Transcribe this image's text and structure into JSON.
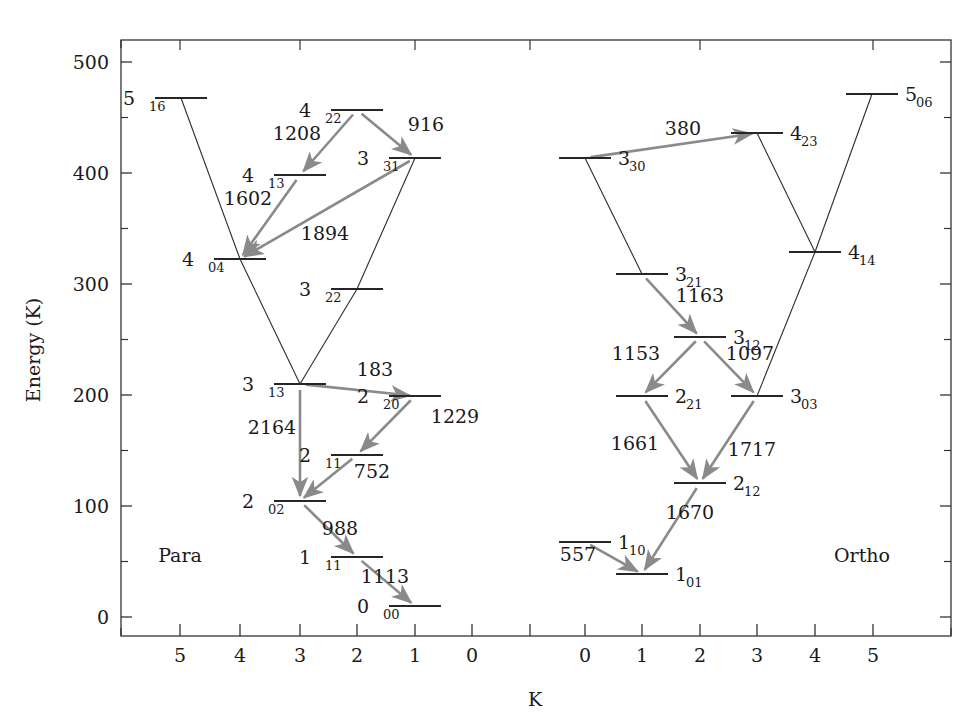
{
  "figure": {
    "xlabel": "K",
    "ylabel": "Energy (K)",
    "branch_left_label": "Para",
    "branch_right_label": "Ortho",
    "colors": {
      "level_line": "#262626",
      "connector_line": "#2b2b2b",
      "transition_arrow": "#8a8a8a",
      "frame": "#333333",
      "text": "#1a1a1a",
      "background": "#ffffff"
    }
  },
  "chart_data": {
    "type": "diagram",
    "title": "",
    "xlabel": "K",
    "ylabel": "Energy (K)",
    "ylim": [
      0,
      540
    ],
    "y_major_ticks": [
      0,
      100,
      200,
      300,
      400,
      500
    ],
    "y_minor_ticks": [
      50,
      150,
      250,
      350,
      450
    ],
    "y_tick_labels": [
      "0",
      "100",
      "200",
      "300",
      "400",
      "500"
    ],
    "x_tick_labels_left": [
      "5",
      "4",
      "3",
      "2",
      "1",
      "0"
    ],
    "x_tick_labels_right": [
      "0",
      "1",
      "2",
      "3",
      "4",
      "5"
    ],
    "grid": false,
    "legend": "none",
    "branches": [
      "Para",
      "Ortho"
    ],
    "levels": [
      {
        "id": "p516",
        "branch": "Para",
        "label": "5",
        "sub": "16",
        "K": 5,
        "energy": 468,
        "px": 181,
        "py": 98,
        "label_side": "left"
      },
      {
        "id": "p422",
        "branch": "Para",
        "label": "4",
        "sub": "22",
        "K": 2,
        "energy": 458,
        "px": 357,
        "py": 110,
        "label_side": "left"
      },
      {
        "id": "p331",
        "branch": "Para",
        "label": "3",
        "sub": "31",
        "K": 1,
        "energy": 415,
        "px": 415,
        "py": 158,
        "label_side": "left"
      },
      {
        "id": "p413",
        "branch": "Para",
        "label": "4",
        "sub": "13",
        "K": 3,
        "energy": 396,
        "px": 300,
        "py": 175,
        "label_side": "left"
      },
      {
        "id": "p404",
        "branch": "Para",
        "label": "4",
        "sub": "04",
        "K": 4,
        "energy": 322,
        "px": 240,
        "py": 259,
        "label_side": "left"
      },
      {
        "id": "p322",
        "branch": "Para",
        "label": "3",
        "sub": "22",
        "K": 2,
        "energy": 296,
        "px": 357,
        "py": 289,
        "label_side": "left"
      },
      {
        "id": "p313",
        "branch": "Para",
        "label": "3",
        "sub": "13",
        "K": 3,
        "energy": 211,
        "px": 300,
        "py": 384,
        "label_side": "left"
      },
      {
        "id": "p220",
        "branch": "Para",
        "label": "2",
        "sub": "20",
        "K": 1,
        "energy": 200,
        "px": 415,
        "py": 396,
        "label_side": "left"
      },
      {
        "id": "p211",
        "branch": "Para",
        "label": "2",
        "sub": "11",
        "K": 2,
        "energy": 146,
        "px": 357,
        "py": 455,
        "label_side": "left"
      },
      {
        "id": "p202",
        "branch": "Para",
        "label": "2",
        "sub": "02",
        "K": 3,
        "energy": 104,
        "px": 300,
        "py": 501,
        "label_side": "left"
      },
      {
        "id": "p111",
        "branch": "Para",
        "label": "1",
        "sub": "11",
        "K": 2,
        "energy": 54,
        "px": 357,
        "py": 557,
        "label_side": "left"
      },
      {
        "id": "p000",
        "branch": "Para",
        "label": "0",
        "sub": "00",
        "K": 1,
        "energy": 10,
        "px": 415,
        "py": 606,
        "label_side": "left"
      },
      {
        "id": "o506",
        "branch": "Ortho",
        "label": "5",
        "sub": "06",
        "K": 5,
        "energy": 472,
        "px": 872,
        "py": 94,
        "label_side": "right"
      },
      {
        "id": "o423",
        "branch": "Ortho",
        "label": "4",
        "sub": "23",
        "K": 3,
        "energy": 436,
        "px": 757,
        "py": 133,
        "label_side": "right"
      },
      {
        "id": "o330",
        "branch": "Ortho",
        "label": "3",
        "sub": "30",
        "K": 0,
        "energy": 414,
        "px": 585,
        "py": 158,
        "label_side": "right"
      },
      {
        "id": "o414",
        "branch": "Ortho",
        "label": "4",
        "sub": "14",
        "K": 4,
        "energy": 329,
        "px": 815,
        "py": 252,
        "label_side": "right"
      },
      {
        "id": "o321",
        "branch": "Ortho",
        "label": "3",
        "sub": "21",
        "K": 1,
        "energy": 310,
        "px": 642,
        "py": 274,
        "label_side": "right"
      },
      {
        "id": "o312",
        "branch": "Ortho",
        "label": "3",
        "sub": "12",
        "K": 2,
        "energy": 253,
        "px": 700,
        "py": 337,
        "label_side": "right"
      },
      {
        "id": "o221",
        "branch": "Ortho",
        "label": "2",
        "sub": "21",
        "K": 1,
        "energy": 200,
        "px": 642,
        "py": 396,
        "label_side": "right"
      },
      {
        "id": "o303",
        "branch": "Ortho",
        "label": "3",
        "sub": "03",
        "K": 3,
        "energy": 200,
        "px": 757,
        "py": 396,
        "label_side": "right"
      },
      {
        "id": "o212",
        "branch": "Ortho",
        "label": "2",
        "sub": "12",
        "K": 2,
        "energy": 121,
        "px": 700,
        "py": 483,
        "label_side": "right"
      },
      {
        "id": "o110",
        "branch": "Ortho",
        "label": "1",
        "sub": "10",
        "K": 0,
        "energy": 68,
        "px": 585,
        "py": 542,
        "label_side": "right"
      },
      {
        "id": "o101",
        "branch": "Ortho",
        "label": "1",
        "sub": "01",
        "K": 1,
        "energy": 39,
        "px": 642,
        "py": 574,
        "label_side": "right"
      }
    ],
    "transitions": [
      {
        "from": "p422",
        "to": "p413",
        "label": "1208",
        "lx": 297,
        "ly": 140
      },
      {
        "from": "p422",
        "to": "p331",
        "label": "916",
        "lx": 426,
        "ly": 131
      },
      {
        "from": "p413",
        "to": "p404",
        "label": "1602",
        "lx": 248,
        "ly": 205
      },
      {
        "from": "p331",
        "to": "p404",
        "label": "1894",
        "lx": 325,
        "ly": 240
      },
      {
        "from": "p313",
        "to": "p220",
        "label": "183",
        "lx": 375,
        "ly": 376
      },
      {
        "from": "p220",
        "to": "p211",
        "label": "1229",
        "lx": 455,
        "ly": 423
      },
      {
        "from": "p211",
        "to": "p202",
        "label": "752",
        "lx": 372,
        "ly": 478
      },
      {
        "from": "p313",
        "to": "p202",
        "label": "2164",
        "lx": 272,
        "ly": 434
      },
      {
        "from": "p202",
        "to": "p111",
        "label": "988",
        "lx": 340,
        "ly": 535
      },
      {
        "from": "p111",
        "to": "p000",
        "label": "1113",
        "lx": 385,
        "ly": 583
      },
      {
        "from": "o330",
        "to": "o423",
        "label": "380",
        "lx": 683,
        "ly": 135
      },
      {
        "from": "o321",
        "to": "o312",
        "label": "1163",
        "lx": 700,
        "ly": 302
      },
      {
        "from": "o312",
        "to": "o221",
        "label": "1153",
        "lx": 636,
        "ly": 360
      },
      {
        "from": "o312",
        "to": "o303",
        "label": "1097",
        "lx": 750,
        "ly": 360
      },
      {
        "from": "o221",
        "to": "o212",
        "label": "1661",
        "lx": 635,
        "ly": 450
      },
      {
        "from": "o303",
        "to": "o212",
        "label": "1717",
        "lx": 752,
        "ly": 456
      },
      {
        "from": "o212",
        "to": "o101",
        "label": "1670",
        "lx": 690,
        "ly": 519
      },
      {
        "from": "o110",
        "to": "o101",
        "label": "557",
        "lx": 578,
        "ly": 561
      }
    ],
    "connectors": [
      {
        "from": "p516",
        "to": "p404",
        "style": "thin"
      },
      {
        "from": "p404",
        "to": "p313",
        "style": "thin"
      },
      {
        "from": "p313",
        "to": "p220",
        "style": "thin"
      },
      {
        "from": "p331",
        "to": "p322",
        "style": "thin"
      },
      {
        "from": "p322",
        "to": "p313",
        "style": "thin"
      },
      {
        "from": "o330",
        "to": "o423",
        "style": "thin"
      },
      {
        "from": "o330",
        "to": "o321",
        "style": "thin"
      },
      {
        "from": "o423",
        "to": "o414",
        "style": "thin"
      },
      {
        "from": "o414",
        "to": "o303",
        "style": "thin"
      },
      {
        "from": "o506",
        "to": "o414",
        "style": "thin"
      }
    ]
  }
}
